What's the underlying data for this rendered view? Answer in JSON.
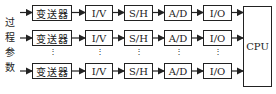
{
  "side_label": [
    "过",
    "程",
    "参",
    "数"
  ],
  "rows": [
    {
      "blocks": [
        "变送器",
        "I/V",
        "S/H",
        "A/D",
        "I/O"
      ]
    },
    {
      "blocks": [
        "变送器",
        "I/V",
        "S/H",
        "A/D",
        "I/O"
      ]
    },
    {
      "blocks": [
        "变送器",
        "I/V",
        "S/H",
        "A/D",
        "I/O"
      ]
    }
  ],
  "cpu_label": "CPU",
  "ellipsis": "⋮"
}
